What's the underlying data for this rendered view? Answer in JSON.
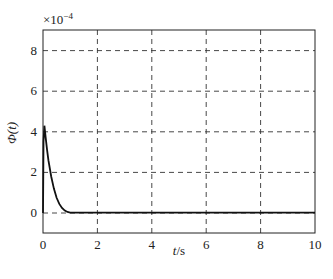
{
  "chart_data": {
    "type": "line",
    "title": "",
    "xlabel": "t/s",
    "ylabel": "Φ(t)",
    "y_multiplier": "×10^-4",
    "y_multiplier_base": "×10",
    "y_multiplier_exp": "−4",
    "xlim": [
      0,
      10
    ],
    "ylim": [
      -0.5,
      9
    ],
    "xticks": [
      "0",
      "2",
      "4",
      "6",
      "8",
      "10"
    ],
    "yticks": [
      "0",
      "2",
      "4",
      "6",
      "8"
    ],
    "grid": "dashed",
    "legend": null,
    "series": [
      {
        "name": "Φ(t)",
        "color": "#111111",
        "x": [
          0,
          0.02,
          0.05,
          0.1,
          0.15,
          0.2,
          0.3,
          0.4,
          0.5,
          0.6,
          0.7,
          0.8,
          0.9,
          1.0,
          1.5,
          2,
          4,
          6,
          8,
          10
        ],
        "y": [
          0,
          3.5,
          4.3,
          3.7,
          3.1,
          2.6,
          1.8,
          1.2,
          0.75,
          0.45,
          0.25,
          0.12,
          0.05,
          0.02,
          0.02,
          0.02,
          0.02,
          0.02,
          0.02,
          0.02
        ]
      }
    ]
  }
}
